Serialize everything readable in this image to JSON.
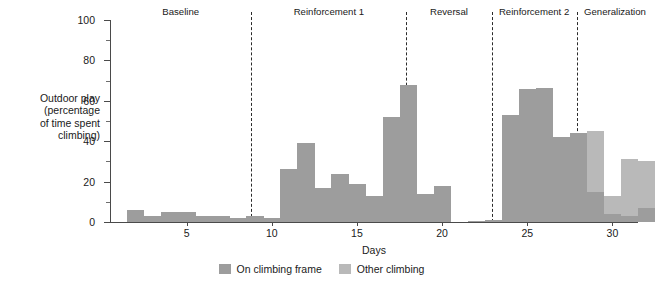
{
  "chart_data": {
    "type": "bar",
    "title": "",
    "xlabel": "Days",
    "ylabel": "Outdoor play (percentage of time spent climbing)",
    "ylim": [
      0,
      100
    ],
    "xlim": [
      1,
      32
    ],
    "grid": false,
    "legend_position": "bottom-center",
    "ytick_labels": [
      "0",
      "20",
      "40",
      "60",
      "80",
      "100"
    ],
    "ytick_values": [
      0,
      20,
      40,
      60,
      80,
      100
    ],
    "yminor_values": [
      10,
      30,
      50,
      70,
      90
    ],
    "xtick_labels": [
      "5",
      "10",
      "15",
      "20",
      "25",
      "30"
    ],
    "xtick_values": [
      5,
      10,
      15,
      20,
      25,
      30
    ],
    "series": [
      {
        "name": "On climbing frame",
        "color": "#9d9d9d",
        "values": [
          6,
          3,
          5,
          5,
          3,
          3,
          2,
          3,
          2,
          26,
          39,
          17,
          24,
          19,
          13,
          52,
          68,
          14,
          18,
          0,
          1,
          53,
          66,
          66.5,
          42,
          44,
          15,
          4,
          3,
          7,
          0
        ]
      },
      {
        "name": "Other climbing",
        "color": "#b9b9b9",
        "values": [
          0,
          0,
          0,
          0,
          0,
          0,
          0,
          0,
          0,
          0,
          0,
          0,
          0,
          0,
          0,
          0,
          0,
          0,
          0,
          0,
          0,
          0,
          0,
          0,
          0,
          0,
          30,
          9,
          28,
          23,
          0
        ]
      }
    ],
    "x": [
      2,
      3,
      4,
      5,
      6,
      7,
      8,
      9,
      10,
      11,
      12,
      13,
      14,
      15,
      16,
      17,
      18,
      19,
      20,
      21,
      22,
      24,
      25,
      26,
      27,
      28,
      29,
      30,
      31,
      32,
      33
    ],
    "bars": [
      {
        "day": 2,
        "on_frame": 6,
        "other": 0
      },
      {
        "day": 3,
        "on_frame": 3,
        "other": 0
      },
      {
        "day": 4,
        "on_frame": 5,
        "other": 0
      },
      {
        "day": 5,
        "on_frame": 5,
        "other": 0
      },
      {
        "day": 6,
        "on_frame": 3,
        "other": 0
      },
      {
        "day": 7,
        "on_frame": 3,
        "other": 0
      },
      {
        "day": 8,
        "on_frame": 2,
        "other": 0
      },
      {
        "day": 9,
        "on_frame": 3,
        "other": 0
      },
      {
        "day": 10,
        "on_frame": 2,
        "other": 0
      },
      {
        "day": 11,
        "on_frame": 26,
        "other": 0
      },
      {
        "day": 12,
        "on_frame": 39,
        "other": 0
      },
      {
        "day": 13,
        "on_frame": 17,
        "other": 0
      },
      {
        "day": 14,
        "on_frame": 24,
        "other": 0
      },
      {
        "day": 15,
        "on_frame": 19,
        "other": 0
      },
      {
        "day": 16,
        "on_frame": 13,
        "other": 0
      },
      {
        "day": 17,
        "on_frame": 52,
        "other": 0
      },
      {
        "day": 18,
        "on_frame": 68,
        "other": 0
      },
      {
        "day": 19,
        "on_frame": 14,
        "other": 0
      },
      {
        "day": 20,
        "on_frame": 18,
        "other": 0
      },
      {
        "day": 22,
        "on_frame": 0.6,
        "other": 0
      },
      {
        "day": 23,
        "on_frame": 1,
        "other": 0
      },
      {
        "day": 24,
        "on_frame": 53,
        "other": 0
      },
      {
        "day": 25,
        "on_frame": 66,
        "other": 0
      },
      {
        "day": 26,
        "on_frame": 66.5,
        "other": 0
      },
      {
        "day": 27,
        "on_frame": 42,
        "other": 0
      },
      {
        "day": 28,
        "on_frame": 44,
        "other": 0
      },
      {
        "day": 29,
        "on_frame": 15,
        "other": 30
      },
      {
        "day": 30,
        "on_frame": 4,
        "other": 9
      },
      {
        "day": 31,
        "on_frame": 3,
        "other": 28
      },
      {
        "day": 32,
        "on_frame": 7,
        "other": 23
      }
    ],
    "phases": [
      {
        "label": "Baseline",
        "start": 1,
        "end": 9.3
      },
      {
        "label": "Reinforcement 1",
        "start": 9.3,
        "end": 18.4
      },
      {
        "label": "Reversal",
        "start": 18.4,
        "end": 23.4
      },
      {
        "label": "Reinforcement 2",
        "start": 23.4,
        "end": 28.4
      },
      {
        "label": "Generalization",
        "start": 28.4,
        "end": 32.9
      }
    ],
    "separators": [
      9.3,
      18.4,
      23.4,
      28.4
    ],
    "colors": {
      "on_climbing_frame": "#9d9d9d",
      "other_climbing": "#b9b9b9",
      "axis": "#4a4a4a",
      "separator": "#2b2b2b",
      "background": "#ffffff",
      "text": "#1a1a1a"
    }
  },
  "legend": {
    "items": [
      {
        "label": "On climbing frame",
        "swatch": "dark"
      },
      {
        "label": "Other climbing",
        "swatch": "light"
      }
    ]
  }
}
